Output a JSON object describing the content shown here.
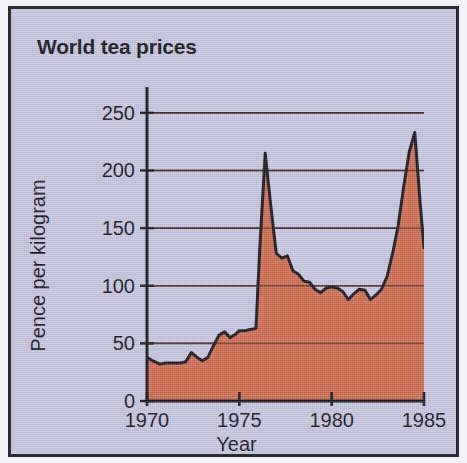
{
  "figure": {
    "title": "World tea prices",
    "background_color": "#c3c2dc",
    "frame_color": "#2b2b33",
    "area_fill_color": "#c96a4e",
    "line_color": "#17171d",
    "gridline_color": "#2e2e3a"
  },
  "chart_data": {
    "type": "area",
    "title": "World tea prices",
    "xlabel": "Year",
    "ylabel": "Pence per kilogram",
    "xlim": [
      1970,
      1985
    ],
    "ylim": [
      0,
      262
    ],
    "grid": true,
    "legend": null,
    "xticks": [
      1970,
      1975,
      1980,
      1985
    ],
    "xtick_labels": [
      "1970",
      "1975",
      "1980",
      "1985"
    ],
    "yticks": [
      0,
      50,
      100,
      150,
      200,
      250
    ],
    "ytick_labels": [
      "0",
      "50",
      "100",
      "150",
      "200",
      "250"
    ],
    "series": [
      {
        "name": "World tea price",
        "units": "pence per kilogram",
        "x": [
          1970.0,
          1970.3,
          1970.7,
          1971.0,
          1971.4,
          1971.8,
          1972.1,
          1972.4,
          1972.7,
          1973.0,
          1973.3,
          1973.6,
          1973.9,
          1974.2,
          1974.5,
          1974.8,
          1975.0,
          1975.3,
          1975.6,
          1975.9,
          1976.1,
          1976.4,
          1976.7,
          1977.0,
          1977.3,
          1977.6,
          1977.9,
          1978.2,
          1978.5,
          1978.8,
          1979.1,
          1979.4,
          1979.7,
          1980.0,
          1980.3,
          1980.6,
          1980.9,
          1981.2,
          1981.5,
          1981.8,
          1982.1,
          1982.4,
          1982.7,
          1983.0,
          1983.3,
          1983.6,
          1983.9,
          1984.2,
          1984.5,
          1984.8,
          1985.0
        ],
        "y": [
          38,
          35,
          32,
          33,
          33,
          33,
          34,
          42,
          38,
          35,
          38,
          48,
          57,
          60,
          55,
          58,
          61,
          61,
          62,
          63,
          130,
          215,
          170,
          128,
          124,
          126,
          113,
          110,
          104,
          103,
          97,
          94,
          98,
          99,
          98,
          95,
          88,
          93,
          97,
          96,
          88,
          92,
          97,
          108,
          128,
          152,
          186,
          216,
          233,
          170,
          133
        ]
      }
    ],
    "annotations": [
      {
        "text": "peak",
        "x": 1976.4,
        "y": 215
      },
      {
        "text": "peak",
        "x": 1984.5,
        "y": 233
      }
    ]
  }
}
